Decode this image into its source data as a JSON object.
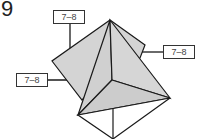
{
  "step": {
    "number": "9"
  },
  "labels": [
    {
      "text": "7–8",
      "position": "top-left"
    },
    {
      "text": "7–8",
      "position": "right"
    },
    {
      "text": "7–8",
      "position": "left"
    }
  ],
  "colors": {
    "fill": "#d4d4d4",
    "stroke": "#1a1a1a"
  }
}
